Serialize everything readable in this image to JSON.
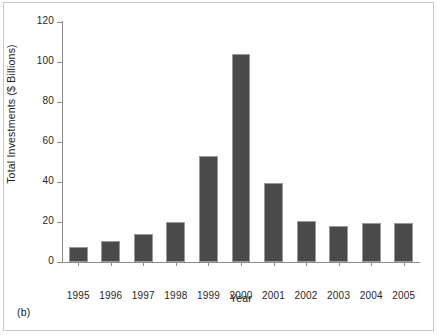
{
  "figure": {
    "panel_caption": "(b)",
    "background_color": "#ffffff",
    "frame_color": "#c9c9c9"
  },
  "chart_data": {
    "type": "bar",
    "title": "",
    "xlabel": "Year",
    "ylabel": "Total Investments ($ Billions)",
    "categories": [
      "1995",
      "1996",
      "1997",
      "1998",
      "1999",
      "2000",
      "2001",
      "2002",
      "2003",
      "2004",
      "2005"
    ],
    "values": [
      7.5,
      10.5,
      14,
      20,
      53,
      104,
      39.5,
      20.3,
      18,
      19.7,
      19.7
    ],
    "ylim": [
      0,
      120
    ],
    "yticks": [
      0,
      20,
      40,
      60,
      80,
      100,
      120
    ],
    "ytick_labels": [
      "0",
      "20",
      "40",
      "60",
      "80",
      "100",
      "120"
    ],
    "grid": false,
    "legend": "none",
    "bar_color": "#4a4a4a",
    "bar_edge_color": "#9a9a9a",
    "axis_color": "#8c8c8c"
  }
}
